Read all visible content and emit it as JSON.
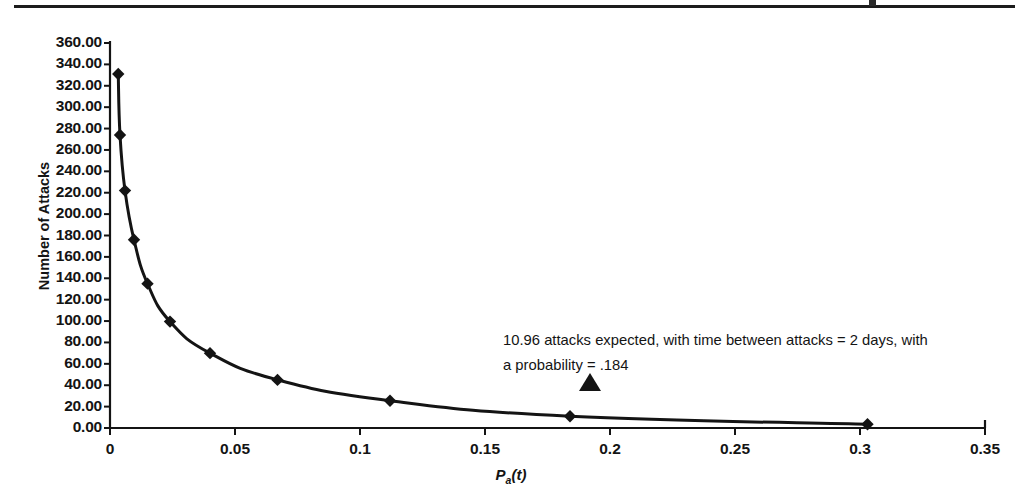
{
  "figure": {
    "top_rule": "horizontal-rule",
    "background_color": "#ffffff",
    "ink_color": "#141414"
  },
  "chart_data": {
    "type": "line",
    "title": "",
    "xlabel": "Pa(t)",
    "ylabel": "Number of Attacks",
    "xlim": [
      0,
      0.35
    ],
    "ylim": [
      0,
      360
    ],
    "grid": false,
    "legend": null,
    "marker": "diamond",
    "series": [
      {
        "name": "Number of Attacks",
        "points": [
          {
            "x": 0.0033,
            "y": 331.0
          },
          {
            "x": 0.004,
            "y": 274.0
          },
          {
            "x": 0.006,
            "y": 222.0
          },
          {
            "x": 0.0096,
            "y": 176.0
          },
          {
            "x": 0.015,
            "y": 135.0
          },
          {
            "x": 0.024,
            "y": 99.5
          },
          {
            "x": 0.04,
            "y": 70.0
          },
          {
            "x": 0.067,
            "y": 45.0
          },
          {
            "x": 0.112,
            "y": 25.5
          },
          {
            "x": 0.184,
            "y": 10.96
          },
          {
            "x": 0.303,
            "y": 3.5
          }
        ]
      }
    ],
    "xticks": [
      "0",
      "0.05",
      "0.1",
      "0.15",
      "0.2",
      "0.25",
      "0.3",
      "0.35"
    ],
    "xtick_values": [
      0,
      0.05,
      0.1,
      0.15,
      0.2,
      0.25,
      0.3,
      0.35
    ],
    "yticks": [
      "0.00",
      "20.00",
      "40.00",
      "60.00",
      "80.00",
      "100.00",
      "120.00",
      "140.00",
      "160.00",
      "180.00",
      "200.00",
      "220.00",
      "240.00",
      "260.00",
      "280.00",
      "300.00",
      "320.00",
      "340.00",
      "360.00"
    ],
    "ytick_values": [
      0,
      20,
      40,
      60,
      80,
      100,
      120,
      140,
      160,
      180,
      200,
      220,
      240,
      260,
      280,
      300,
      320,
      340,
      360
    ],
    "annotations": [
      {
        "name": "callout-10-96-attacks",
        "line1": "10.96 attacks expected, with time between attacks =  2 days, with",
        "line2": "a probability = .184",
        "marker": "triangle-up",
        "marker_x": 0.184,
        "marker_y": 10.96
      }
    ]
  },
  "axis_titles": {
    "y": "Number of Attacks",
    "x_main": "P",
    "x_sub": "a",
    "x_tail": "(t)"
  }
}
